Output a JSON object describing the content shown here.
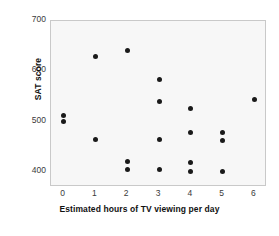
{
  "chart_data": {
    "type": "scatter",
    "title": "",
    "xlabel": "Estimated hours of TV viewing per day",
    "ylabel": "SAT score",
    "xlim": [
      -0.4,
      6.4
    ],
    "ylim": [
      370,
      700
    ],
    "xticks": [
      "0",
      "1",
      "2",
      "3",
      "4",
      "5",
      "6"
    ],
    "xtick_values": [
      0,
      1,
      2,
      3,
      4,
      5,
      6
    ],
    "yticks": [
      "400",
      "500",
      "600",
      "700"
    ],
    "ytick_values": [
      400,
      500,
      600,
      700
    ],
    "grid": false,
    "legend": null,
    "point_color": "#1a1a1a",
    "plot_background": "#f7f7f7",
    "points": [
      {
        "x": 0,
        "y": 513
      },
      {
        "x": 0,
        "y": 501
      },
      {
        "x": 1,
        "y": 630
      },
      {
        "x": 1,
        "y": 465
      },
      {
        "x": 2,
        "y": 641
      },
      {
        "x": 2,
        "y": 420
      },
      {
        "x": 2,
        "y": 404
      },
      {
        "x": 3,
        "y": 583
      },
      {
        "x": 3,
        "y": 540
      },
      {
        "x": 3,
        "y": 465
      },
      {
        "x": 3,
        "y": 404
      },
      {
        "x": 4,
        "y": 527
      },
      {
        "x": 4,
        "y": 479
      },
      {
        "x": 4,
        "y": 419
      },
      {
        "x": 4,
        "y": 401
      },
      {
        "x": 5,
        "y": 479
      },
      {
        "x": 5,
        "y": 463
      },
      {
        "x": 5,
        "y": 400
      },
      {
        "x": 6,
        "y": 543
      }
    ]
  }
}
